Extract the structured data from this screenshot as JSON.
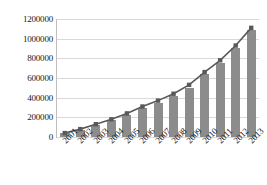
{
  "chart_data": {
    "type": "bar",
    "title": "",
    "subtitle": "",
    "xlabel": "",
    "ylabel": "",
    "categories": [
      "2001",
      "2002",
      "2003",
      "2004",
      "2005",
      "2006",
      "2007",
      "2008",
      "2009",
      "2010",
      "2011",
      "2012",
      "2013"
    ],
    "series": [
      {
        "name": "bars",
        "type": "bar",
        "values": [
          40000,
          70000,
          120000,
          170000,
          220000,
          290000,
          350000,
          420000,
          500000,
          640000,
          750000,
          910000,
          1090000
        ]
      },
      {
        "name": "trend",
        "type": "line",
        "marker": "square",
        "values": [
          40000,
          80000,
          130000,
          180000,
          240000,
          310000,
          370000,
          440000,
          530000,
          660000,
          780000,
          930000,
          1110000
        ]
      }
    ],
    "ylim": [
      0,
      1200000
    ],
    "ytick_values": [
      0,
      200000,
      400000,
      600000,
      800000,
      1000000,
      1200000
    ],
    "ytick_labels": [
      "0",
      "200000",
      "400000",
      "600000",
      "800000",
      "1000000",
      "1200000"
    ],
    "grid": true,
    "grid_axis": "y",
    "legend": false,
    "legend_position": "none",
    "colors": {
      "bar": "#8c8c8c",
      "line": "#595959",
      "marker": "#595959",
      "grid": "#d9d9d9",
      "axis": "#bfbfbf",
      "text": "#1a1a1a",
      "background": "#ffffff"
    }
  }
}
